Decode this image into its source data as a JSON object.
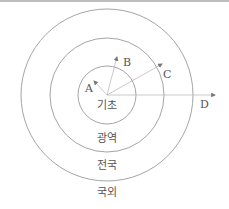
{
  "diagram": {
    "type": "concentric-circles",
    "center": [
      107,
      95
    ],
    "rings": [
      {
        "label": "기초",
        "radius": 29
      },
      {
        "label": "광역",
        "radius": 57
      },
      {
        "label": "전국",
        "radius": 86
      },
      {
        "label": "국외",
        "radius": null
      }
    ],
    "arrows": [
      {
        "label": "A",
        "to": [
          93,
          80
        ]
      },
      {
        "label": "B",
        "to": [
          115,
          57
        ]
      },
      {
        "label": "C",
        "to": [
          143,
          67
        ]
      },
      {
        "label": "D",
        "to": [
          213,
          95
        ]
      }
    ],
    "colors": {
      "line": "#9a9a9a",
      "arrow": "#777777",
      "text": "#555555"
    }
  }
}
